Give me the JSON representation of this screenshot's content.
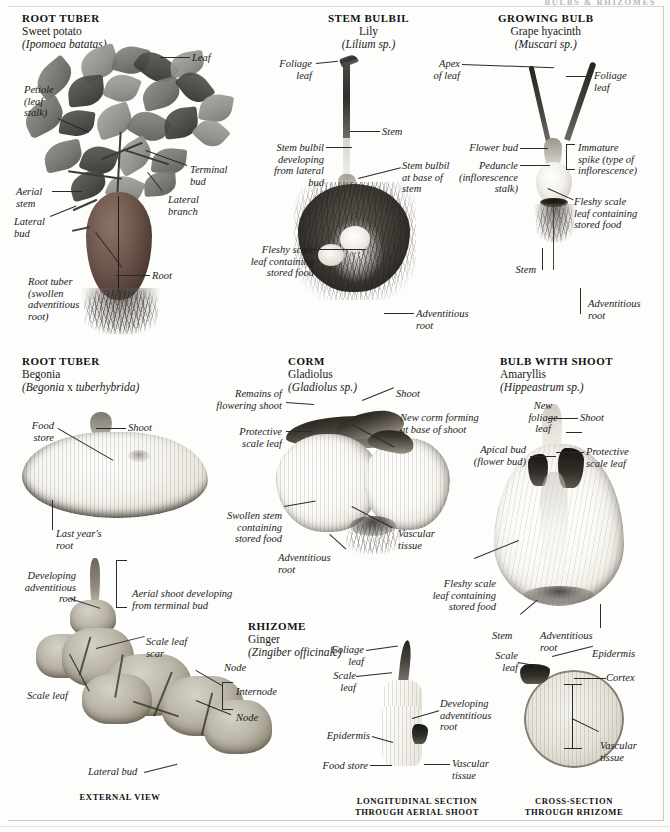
{
  "page": {
    "running_head": "BULBS & RHIZOMES",
    "background": "#fdfdfc",
    "rule_color": "#c9c9c9"
  },
  "specimens": [
    {
      "id": "sweet-potato",
      "category": "ROOT TUBER",
      "common_name": "Sweet potato",
      "latin_name": "(Ipomoea batatas)",
      "labels": [
        "Leaf",
        "Petiole\n(leaf\nstalk)",
        "Terminal\nbud",
        "Aerial\nstem",
        "Lateral\nbranch",
        "Lateral\nbud",
        "Root tuber\n(swollen\nadventitious\nroot)",
        "Root"
      ]
    },
    {
      "id": "lily",
      "category": "STEM BULBIL",
      "common_name": "Lily",
      "latin_name": "(Lilium sp.)",
      "labels": [
        "Foliage\nleaf",
        "Stem",
        "Stem bulbil\ndeveloping\nfrom lateral\nbud",
        "Stem bulbil\nat base of\nstem",
        "Fleshy scale\nleaf containing\nstored food",
        "Adventitious\nroot"
      ]
    },
    {
      "id": "grape-hyacinth",
      "category": "GROWING BULB",
      "common_name": "Grape hyacinth",
      "latin_name": "(Muscari sp.)",
      "labels": [
        "Apex\nof leaf",
        "Foliage\nleaf",
        "Flower bud",
        "Immature\nspike (type of\ninflorescence)",
        "Peduncle\n(inflorescence\nstalk)",
        "Fleshy scale\nleaf containing\nstored food",
        "Stem",
        "Adventitious\nroot"
      ]
    },
    {
      "id": "begonia",
      "category": "ROOT TUBER",
      "common_name": "Begonia",
      "latin_name_pre": "(Begonia",
      "latin_name_mid": " x ",
      "latin_name_post": "tuberhybrida)",
      "labels": [
        "Food\nstore",
        "Shoot",
        "Last year's\nroot"
      ]
    },
    {
      "id": "gladiolus",
      "category": "CORM",
      "common_name": "Gladiolus",
      "latin_name": "(Gladiolus sp.)",
      "labels": [
        "Remains of\nflowering shoot",
        "Shoot",
        "New corm forming\nat base of shoot",
        "Protective\nscale leaf",
        "Swollen stem\ncontaining\nstored food",
        "Vascular\ntissue",
        "Adventitious\nroot"
      ]
    },
    {
      "id": "amaryllis",
      "category": "BULB WITH SHOOT",
      "common_name": "Amaryllis",
      "latin_name": "(Hippeastrum sp.)",
      "labels": [
        "New\nfoliage\nleaf",
        "Shoot",
        "Apical bud\n(flower bud)",
        "Protective\nscale leaf",
        "Fleshy scale\nleaf containing\nstored food",
        "Stem",
        "Adventitious\nroot"
      ]
    },
    {
      "id": "ginger",
      "category": "RHIZOME",
      "common_name": "Ginger",
      "latin_name": "(Zingiber officinale)",
      "labels": [
        "Developing\nadventitious\nroot",
        "Aerial shoot developing\nfrom terminal bud",
        "Scale leaf\nscar",
        "Node",
        "Internode",
        "Node",
        "Scale leaf",
        "Lateral bud"
      ],
      "caption": "EXTERNAL VIEW"
    },
    {
      "id": "ginger-longitudinal",
      "labels": [
        "Foliage\nleaf",
        "Scale\nleaf",
        "Developing\nadventitious\nroot",
        "Epidermis",
        "Food store",
        "Vascular\ntissue"
      ],
      "caption": "LONGITUDINAL SECTION\nTHROUGH AERIAL SHOOT"
    },
    {
      "id": "ginger-cross",
      "labels": [
        "Scale\nleaf",
        "Epidermis",
        "Cortex",
        "Vascular\ntissue"
      ],
      "caption": "CROSS-SECTION\nTHROUGH RHIZOME"
    }
  ],
  "labels": {
    "leaf": "Leaf",
    "petiole": "Petiole\n(leaf\nstalk)",
    "terminal_bud": "Terminal\nbud",
    "aerial_stem": "Aerial\nstem",
    "lateral_branch": "Lateral\nbranch",
    "lateral_bud": "Lateral\nbud",
    "root_tuber_swollen": "Root tuber\n(swollen\nadventitious\nroot)",
    "root": "Root",
    "foliage_leaf": "Foliage\nleaf",
    "stem": "Stem",
    "stem_bulbil_dev": "Stem bulbil\ndeveloping\nfrom lateral\nbud",
    "stem_bulbil_base": "Stem bulbil\nat base of\nstem",
    "fleshy_scale_leaf": "Fleshy scale\nleaf containing\nstored food",
    "adventitious_root": "Adventitious\nroot",
    "apex_of_leaf": "Apex\nof leaf",
    "foliage_leaf_hy": "Foliage\nleaf",
    "flower_bud": "Flower bud",
    "immature_spike": "Immature\nspike (type of\ninflorescence)",
    "peduncle": "Peduncle\n(inflorescence\nstalk)",
    "fleshy_scale_leaf_hy": "Fleshy scale\nleaf containing\nstored food",
    "stem_hy": "Stem",
    "adventitious_root_hy": "Adventitious\nroot",
    "food_store": "Food\nstore",
    "shoot": "Shoot",
    "last_years_root": "Last year's\nroot",
    "remains_flowering_shoot": "Remains of\nflowering shoot",
    "shoot_corm": "Shoot",
    "new_corm_forming": "New corm forming\nat base of shoot",
    "protective_scale_leaf": "Protective\nscale leaf",
    "swollen_stem": "Swollen stem\ncontaining\nstored food",
    "vascular_tissue_corm": "Vascular\ntissue",
    "adventitious_root_corm": "Adventitious\nroot",
    "new_foliage_leaf": "New\nfoliage\nleaf",
    "shoot_amary": "Shoot",
    "apical_bud": "Apical bud\n(flower bud)",
    "protective_scale_leaf_amary": "Protective\nscale leaf",
    "fleshy_scale_leaf_amary": "Fleshy scale\nleaf containing\nstored food",
    "stem_amary": "Stem",
    "adventitious_root_amary": "Adventitious\nroot",
    "developing_adv_root": "Developing\nadventitious\nroot",
    "aerial_shoot_dev": "Aerial shoot developing\nfrom terminal bud",
    "scale_leaf_scar": "Scale leaf\nscar",
    "node_1": "Node",
    "internode": "Internode",
    "node_2": "Node",
    "scale_leaf_gin": "Scale leaf",
    "lateral_bud_gin": "Lateral bud",
    "foliage_leaf_ls": "Foliage\nleaf",
    "scale_leaf_ls": "Scale\nleaf",
    "developing_adv_root_ls": "Developing\nadventitious\nroot",
    "epidermis_ls": "Epidermis",
    "food_store_ls": "Food store",
    "vascular_tissue_ls": "Vascular\ntissue",
    "scale_leaf_xs": "Scale\nleaf",
    "epidermis_xs": "Epidermis",
    "cortex_xs": "Cortex",
    "vascular_tissue_xs": "Vascular\ntissue"
  },
  "captions": {
    "external_view": "EXTERNAL VIEW",
    "longitudinal": "LONGITUDINAL SECTION\nTHROUGH AERIAL SHOOT",
    "cross_section": "CROSS-SECTION\nTHROUGH RHIZOME"
  }
}
